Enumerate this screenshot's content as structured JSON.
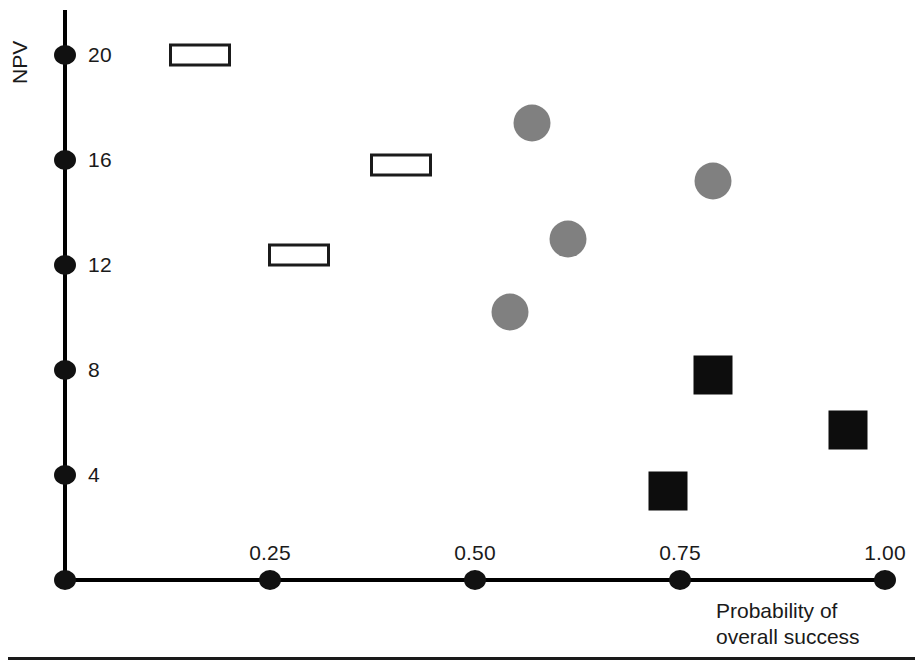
{
  "chart_data": {
    "type": "scatter",
    "title": "",
    "xlabel": "Probability of\noverall success",
    "ylabel": "NPV",
    "xlim": [
      0,
      1.0
    ],
    "ylim": [
      0,
      21
    ],
    "grid": false,
    "legend": "none",
    "x_ticks": [
      {
        "value": 0.25,
        "label": "0.25"
      },
      {
        "value": 0.5,
        "label": "0.50"
      },
      {
        "value": 0.75,
        "label": "0.75"
      },
      {
        "value": 1.0,
        "label": "1.00"
      }
    ],
    "y_ticks": [
      {
        "value": 20,
        "label": "20"
      },
      {
        "value": 16,
        "label": "16"
      },
      {
        "value": 12,
        "label": "12"
      },
      {
        "value": 8,
        "label": "8"
      },
      {
        "value": 4,
        "label": "4"
      }
    ],
    "origin_marker": true,
    "series": [
      {
        "name": "open-rectangle",
        "marker": "rectangle",
        "fill": "#ffffff",
        "stroke": "#1b1b1b",
        "points": [
          {
            "x": 0.165,
            "y": 20.0
          },
          {
            "x": 0.41,
            "y": 15.8
          },
          {
            "x": 0.285,
            "y": 12.4
          }
        ]
      },
      {
        "name": "gray-circle",
        "marker": "circle",
        "fill": "#808080",
        "stroke": "#808080",
        "points": [
          {
            "x": 0.57,
            "y": 17.4
          },
          {
            "x": 0.79,
            "y": 15.2
          },
          {
            "x": 0.613,
            "y": 13.0
          },
          {
            "x": 0.543,
            "y": 10.2
          }
        ]
      },
      {
        "name": "black-square",
        "marker": "square",
        "fill": "#0d0d0d",
        "stroke": "#0d0d0d",
        "points": [
          {
            "x": 0.79,
            "y": 7.8
          },
          {
            "x": 0.955,
            "y": 5.7
          },
          {
            "x": 0.735,
            "y": 3.4
          }
        ]
      }
    ]
  },
  "colors": {
    "axis": "#000000",
    "text": "#1a1a1a",
    "circle_fill": "#808080",
    "square_fill": "#0d0d0d",
    "rect_stroke": "#1b1b1b",
    "rect_fill": "#ffffff",
    "background": "#ffffff"
  }
}
